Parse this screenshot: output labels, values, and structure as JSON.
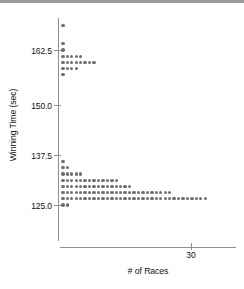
{
  "chart_data": {
    "type": "scatter",
    "subtype": "dot-plot",
    "title": "",
    "xlabel": "# of Races",
    "ylabel": "Winning Time (sec)",
    "x_ticks": [
      30
    ],
    "x_tick_labels": [
      "30"
    ],
    "y_ticks": [
      125.0,
      137.5,
      150.0,
      162.5
    ],
    "y_tick_labels": [
      "125.0",
      "137.5",
      "150.0",
      "162.5"
    ],
    "xlim": [
      0,
      40
    ],
    "ylim": [
      118,
      170
    ],
    "grid": false,
    "legend": null,
    "marker_color": "#6f6f6f",
    "axis_color": "#8f8f8f",
    "rows": [
      {
        "winning_time": 168.5,
        "count": 1
      },
      {
        "winning_time": 164.0,
        "count": 1
      },
      {
        "winning_time": 162.5,
        "count": 1
      },
      {
        "winning_time": 161.0,
        "count": 5
      },
      {
        "winning_time": 159.5,
        "count": 8
      },
      {
        "winning_time": 158.0,
        "count": 4
      },
      {
        "winning_time": 156.5,
        "count": 1
      },
      {
        "winning_time": 135.5,
        "count": 1
      },
      {
        "winning_time": 134.0,
        "count": 2
      },
      {
        "winning_time": 132.5,
        "count": 5
      },
      {
        "winning_time": 131.0,
        "count": 13
      },
      {
        "winning_time": 129.5,
        "count": 16
      },
      {
        "winning_time": 128.0,
        "count": 25
      },
      {
        "winning_time": 126.5,
        "count": 33
      },
      {
        "winning_time": 125.0,
        "count": 2
      }
    ],
    "values": [
      1,
      1,
      1,
      5,
      8,
      4,
      1,
      1,
      2,
      5,
      13,
      16,
      25,
      33,
      2
    ],
    "categories": [
      168.5,
      164.0,
      162.5,
      161.0,
      159.5,
      158.0,
      156.5,
      135.5,
      134.0,
      132.5,
      131.0,
      129.5,
      128.0,
      126.5,
      125.0
    ],
    "total_races": 118
  },
  "figure": {
    "caption_fragment": "stem-and-leaf / dot plot of winning times"
  }
}
